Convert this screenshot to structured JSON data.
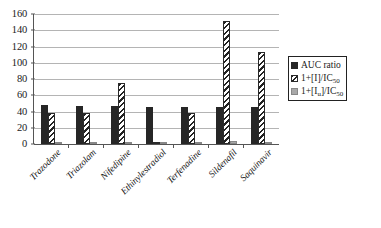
{
  "chart_data": {
    "type": "bar",
    "title": "",
    "xlabel": "",
    "ylabel": "",
    "ylim": [
      0,
      160
    ],
    "ytick_step": 20,
    "yticks": [
      160,
      140,
      120,
      100,
      80,
      60,
      40,
      20,
      0
    ],
    "grid": true,
    "legend_position": "right",
    "categories": [
      "Trazodone",
      "Triazolam",
      "Nifedipine",
      "Ethinylestradiol",
      "Terfenadine",
      "Sildenafil",
      "Saquinavir"
    ],
    "series": [
      {
        "name": "AUC ratio",
        "pattern": "solid-black",
        "color": "#262626",
        "values": [
          48,
          47,
          47,
          46,
          46,
          46,
          46
        ]
      },
      {
        "name": "1+[I]/IC50",
        "pattern": "diagonal-hatch",
        "color": "#ffffff",
        "values": [
          38,
          38,
          75,
          3,
          38,
          152,
          113
        ]
      },
      {
        "name": "1+[Iu]/IC50",
        "pattern": "solid-gray",
        "color": "#a8a8a8",
        "values": [
          1.5,
          1.5,
          2,
          1,
          3,
          4,
          3
        ]
      }
    ]
  },
  "legend": {
    "entries": [
      {
        "label_main": "AUC ratio",
        "label_sub": "",
        "label_tail": ""
      },
      {
        "label_main": "1+[I]/IC",
        "label_sub": "50",
        "label_tail": ""
      },
      {
        "label_main": "1+[I",
        "label_sub": "u",
        "label_tail": "]/IC",
        "label_sub2": "50"
      }
    ]
  },
  "colors": {
    "series_0": "#262626",
    "series_1": "#ffffff",
    "series_2": "#a8a8a8",
    "gridline": "#b4b4b4",
    "axis": "#555555",
    "background": "#ffffff"
  }
}
